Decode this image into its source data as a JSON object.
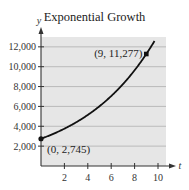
{
  "chart_data": {
    "type": "line",
    "title": "Exponential Growth",
    "xlabel": "t",
    "ylabel": "y",
    "xlim": [
      0,
      10.8
    ],
    "ylim": [
      0,
      12900
    ],
    "x_ticks": [
      2,
      4,
      6,
      8,
      10
    ],
    "x_tick_labels": [
      "2",
      "4",
      "6",
      "8",
      "10"
    ],
    "y_ticks": [
      2000,
      4000,
      6000,
      8000,
      10000,
      12000
    ],
    "y_tick_labels": [
      "2,000",
      "4,000",
      "6,000",
      "8,000",
      "10,000",
      "12,000"
    ],
    "grid": {
      "horizontal": true,
      "vertical": false
    },
    "series": [
      {
        "name": "y = 2745 e^(0.157t)",
        "function": {
          "a": 2745,
          "k": 0.157
        },
        "x": [
          0,
          1,
          2,
          3,
          4,
          5,
          6,
          7,
          8,
          9,
          9.7
        ],
        "values": [
          2745,
          3212,
          3759,
          4399,
          5148,
          6025,
          7050,
          8250,
          9655,
          11277,
          12570
        ]
      }
    ],
    "points": [
      {
        "x": 0,
        "y": 2745,
        "label": "(0, 2,745)"
      },
      {
        "x": 9,
        "y": 11277,
        "label": "(9, 11,277)"
      }
    ],
    "colors": {
      "plot_bg": "#e6e6e6",
      "grid": "#a8a8a8",
      "curve": "#111111",
      "axis": "#333333"
    }
  }
}
